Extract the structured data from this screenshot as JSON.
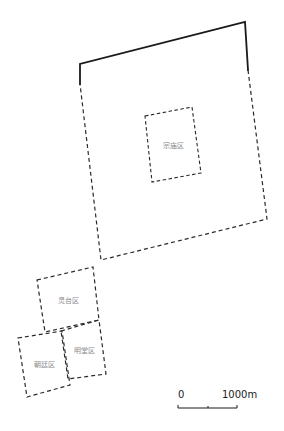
{
  "map": {
    "zones": [
      {
        "id": "outer-city",
        "label": "",
        "points": [
          [
            80,
            64
          ],
          [
            245,
            22
          ],
          [
            267,
            219
          ],
          [
            101,
            260
          ]
        ]
      },
      {
        "id": "zongmiao",
        "label": "宗庙区",
        "points": [
          [
            145,
            116
          ],
          [
            192,
            107
          ],
          [
            201,
            173
          ],
          [
            152,
            182
          ]
        ],
        "label_pos": [
          173,
          146
        ]
      },
      {
        "id": "lingtai",
        "label": "灵台区",
        "points": [
          [
            37,
            280
          ],
          [
            93,
            267
          ],
          [
            99,
            320
          ],
          [
            45,
            332
          ]
        ],
        "label_pos": [
          68,
          301
        ]
      },
      {
        "id": "mingtang",
        "label": "明堂区",
        "points": [
          [
            61,
            331
          ],
          [
            99,
            320
          ],
          [
            106,
            374
          ],
          [
            68,
            379
          ]
        ],
        "label_pos": [
          84,
          351
        ]
      },
      {
        "id": "chaoting",
        "label": "朝廷区",
        "points": [
          [
            18,
            338
          ],
          [
            62,
            331
          ],
          [
            70,
            385
          ],
          [
            27,
            397
          ]
        ],
        "label_pos": [
          44,
          365
        ]
      }
    ],
    "scale_bar": {
      "start_label": "0",
      "end_label": "1000m",
      "x_start": 178,
      "x_mid": 208,
      "x_end": 237,
      "y": 408
    },
    "colors": {
      "line": "#1a1a1a",
      "label": "#8a8a8a",
      "background": "#ffffff"
    }
  }
}
